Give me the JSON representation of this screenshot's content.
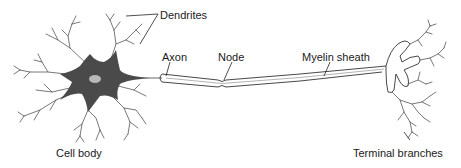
{
  "diagram": {
    "colors": {
      "cell_body": "#4a4a4a",
      "nucleus": "#b8b8b8",
      "line": "#333333",
      "background": "#ffffff"
    },
    "labels": {
      "dendrites": "Dendrites",
      "axon": "Axon",
      "node": "Node",
      "myelin_sheath": "Myelin sheath",
      "cell_body": "Cell body",
      "terminal_branches": "Terminal branches"
    }
  }
}
